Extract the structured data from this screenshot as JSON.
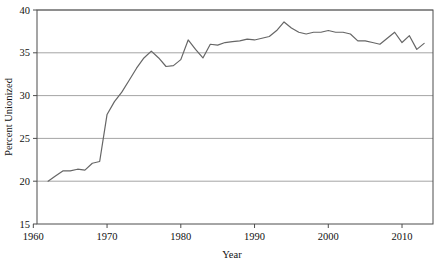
{
  "chart_data": {
    "type": "line",
    "title": "",
    "xlabel": "Year",
    "ylabel": "Percent Unionized",
    "xlim": [
      1960.5,
      2014.2
    ],
    "ylim": [
      15,
      40
    ],
    "xticks": [
      1960,
      1970,
      1980,
      1990,
      2000,
      2010
    ],
    "xtick_labels": [
      "1960",
      "1970",
      "1980",
      "1990",
      "2000",
      "2010"
    ],
    "yticks": [
      15,
      20,
      25,
      30,
      35,
      40
    ],
    "ytick_labels": [
      "15",
      "20",
      "25",
      "30",
      "35",
      "40"
    ],
    "grid": "horizontal",
    "gridlines_at": [
      20,
      25,
      30,
      35,
      40
    ],
    "legend": "none",
    "line_color": "#666666",
    "line_width": 1.2,
    "frame_color": "#4d4d4d",
    "grid_color": "#9a9a9a",
    "background": "#ffffff",
    "series": [
      {
        "name": "Percent Unionized",
        "x": [
          1962,
          1963,
          1964,
          1965,
          1966,
          1967,
          1968,
          1969,
          1970,
          1971,
          1972,
          1973,
          1974,
          1975,
          1976,
          1977,
          1978,
          1979,
          1980,
          1981,
          1982,
          1983,
          1984,
          1985,
          1986,
          1987,
          1988,
          1989,
          1990,
          1991,
          1992,
          1993,
          1994,
          1995,
          1996,
          1997,
          1998,
          1999,
          2000,
          2001,
          2002,
          2003,
          2004,
          2005,
          2006,
          2007,
          2008,
          2009,
          2010,
          2011,
          2012,
          2013
        ],
        "values": [
          20.0,
          20.6,
          21.2,
          21.2,
          21.4,
          21.3,
          22.1,
          22.3,
          27.8,
          29.3,
          30.4,
          31.8,
          33.2,
          34.4,
          35.2,
          34.4,
          33.4,
          33.5,
          34.2,
          36.5,
          35.4,
          34.4,
          36.0,
          35.9,
          36.2,
          36.3,
          36.4,
          36.6,
          36.5,
          36.7,
          36.9,
          37.6,
          38.6,
          37.9,
          37.4,
          37.2,
          37.4,
          37.4,
          37.6,
          37.4,
          37.4,
          37.2,
          36.4,
          36.4,
          36.2,
          36.0,
          36.7,
          37.4,
          36.2,
          37.0,
          35.4,
          36.1
        ]
      }
    ]
  },
  "axis": {
    "xlabel": "Year",
    "ylabel": "Percent Unionized"
  }
}
